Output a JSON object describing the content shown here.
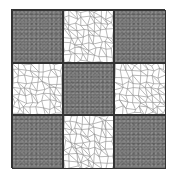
{
  "figure": {
    "rows": 3,
    "cols": 3,
    "cells": [
      {
        "pattern": "dark"
      },
      {
        "pattern": "light"
      },
      {
        "pattern": "dark"
      },
      {
        "pattern": "light"
      },
      {
        "pattern": "dark"
      },
      {
        "pattern": "light"
      },
      {
        "pattern": "dark"
      },
      {
        "pattern": "light"
      },
      {
        "pattern": "dark"
      }
    ],
    "colors": {
      "dark": "#6e6e6e",
      "light": "#ffffff",
      "net": "#8a8a8a",
      "border": "#333333"
    }
  }
}
